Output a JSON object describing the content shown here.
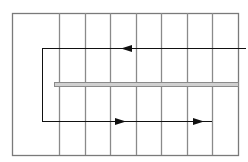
{
  "diagram": {
    "width": 248,
    "height": 162,
    "colors": {
      "background": "#ffffff",
      "grid_line": "#8a8a8a",
      "border": "#7a7a7a",
      "arrow": "#111111",
      "bar_fill": "#d0d0d0",
      "bar_stroke": "#8a8a8a"
    },
    "outer_rect": {
      "x1": 12,
      "y1": 13,
      "x2": 238,
      "y2": 155
    },
    "vertical_lines_x": [
      59,
      85,
      110,
      136,
      161,
      187,
      212
    ],
    "inner_bracket": {
      "x": 42,
      "y_top": 48,
      "y_bottom": 121
    },
    "top_arrow": {
      "y": 48,
      "x_start": 42,
      "x_end": 246,
      "head_x": 121,
      "direction": "left"
    },
    "bottom_arrow": {
      "y": 121,
      "x_start": 42,
      "x_end": 212,
      "heads_x": [
        126,
        204
      ],
      "direction": "right"
    },
    "double_bar": {
      "x1": 54,
      "x2": 238,
      "y1": 82,
      "y2": 86
    }
  }
}
